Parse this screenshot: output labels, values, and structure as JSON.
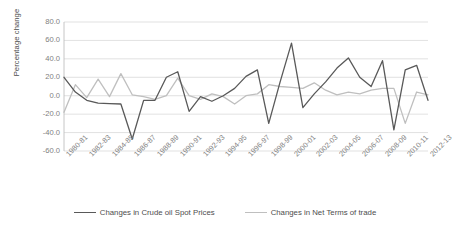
{
  "chart_data": {
    "type": "line",
    "title": "",
    "xlabel": "",
    "ylabel": "Percentage change",
    "ylim": [
      -60,
      80
    ],
    "yticks": [
      80.0,
      60.0,
      40.0,
      20.0,
      0.0,
      -20.0,
      -40.0,
      -60.0
    ],
    "ytick_labels": [
      "80.0",
      "60.0",
      "40.0",
      "20.0",
      "0.0",
      "-20.0",
      "-40.0",
      "-60.0"
    ],
    "grid": true,
    "legend_position": "bottom",
    "categories": [
      "1980-81",
      "1981-82",
      "1982-83",
      "1983-84",
      "1984-85",
      "1985-86",
      "1986-87",
      "1987-88",
      "1988-89",
      "1989-90",
      "1990-91",
      "1991-92",
      "1992-93",
      "1993-94",
      "1994-95",
      "1995-96",
      "1996-97",
      "1997-98",
      "1998-99",
      "1999-00",
      "2000-01",
      "2001-02",
      "2002-03",
      "2003-04",
      "2004-05",
      "2005-06",
      "2006-07",
      "2007-08",
      "2008-09",
      "2009-10",
      "2010-11",
      "2011-12",
      "2012-13"
    ],
    "xtick_labels": [
      "1980-81",
      "1982-83",
      "1984-85",
      "1986-87",
      "1988-89",
      "1990-91",
      "1992-93",
      "1994-95",
      "1996-97",
      "1998-99",
      "2000-01",
      "2002-03",
      "2004-05",
      "2006-07",
      "2008-09",
      "2010-11",
      "2012-13"
    ],
    "series": [
      {
        "name": "Changes in Crude oil Spot Prices",
        "color": "#595959",
        "values": [
          20.0,
          4.0,
          -5.0,
          -8.0,
          -8.5,
          -9.0,
          -47.0,
          -5.0,
          -5.0,
          20.0,
          26.0,
          -17.0,
          -1.0,
          -6.0,
          0.0,
          8.0,
          21.0,
          28.0,
          -30.0,
          15.0,
          57.0,
          -13.0,
          2.0,
          15.0,
          30.0,
          41.0,
          20.0,
          10.0,
          38.0,
          -37.0,
          28.0,
          33.0,
          -5.0
        ]
      },
      {
        "name": "Changes in Net Terms of trade",
        "color": "#bfbfbf",
        "values": [
          -18.0,
          12.0,
          -2.0,
          18.0,
          -1.0,
          24.0,
          1.0,
          -1.0,
          -4.0,
          0.0,
          19.0,
          0.0,
          -4.0,
          2.0,
          -1.0,
          -9.0,
          0.0,
          2.0,
          12.0,
          10.0,
          9.0,
          8.0,
          14.0,
          6.0,
          1.0,
          4.0,
          2.0,
          6.0,
          8.0,
          8.0,
          -30.0,
          4.0,
          1.0
        ]
      }
    ]
  },
  "legend": {
    "items": [
      {
        "label": "Changes in Crude oil Spot Prices",
        "color": "#595959"
      },
      {
        "label": "Changes in Net Terms of trade",
        "color": "#bfbfbf"
      }
    ]
  }
}
